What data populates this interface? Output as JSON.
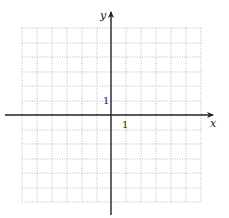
{
  "diagram": {
    "type": "coordinate-grid",
    "x_axis_label": "x",
    "y_axis_label": "y",
    "x_tick_label": "1",
    "y_tick_label": "1",
    "grid": {
      "columns": 12,
      "rows": 12,
      "x_range": [
        -6,
        6
      ],
      "y_range": [
        -6,
        6
      ],
      "line_style": "dotted"
    },
    "colors": {
      "grid": "#b8b8b8",
      "axis": "#222222"
    }
  }
}
